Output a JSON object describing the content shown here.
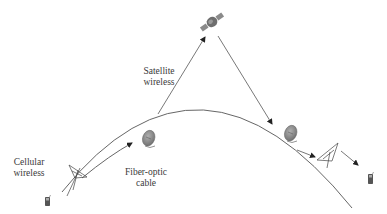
{
  "labels": {
    "satellite": [
      "Satellite",
      "wireless"
    ],
    "cellular": [
      "Cellular",
      "wireless"
    ],
    "fiber": [
      "Fiber-optic",
      "cable"
    ]
  },
  "nodes": [
    {
      "id": "satellite",
      "icon": "satellite-icon"
    },
    {
      "id": "left-tower",
      "icon": "cell-tower-icon"
    },
    {
      "id": "left-phone",
      "icon": "mobile-phone-icon"
    },
    {
      "id": "left-dish",
      "icon": "satellite-dish-icon"
    },
    {
      "id": "right-dish",
      "icon": "satellite-dish-icon"
    },
    {
      "id": "right-tower",
      "icon": "cell-tower-icon"
    },
    {
      "id": "right-phone",
      "icon": "mobile-phone-icon"
    }
  ],
  "colors": {
    "line": "#555555",
    "icon_fill": "#8a8a8a",
    "text": "#3a3a3a"
  }
}
